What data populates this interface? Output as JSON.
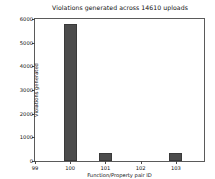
{
  "chart_data": {
    "type": "bar",
    "title": "Violations generated across 14610 uploads",
    "xlabel": "Function/Property pair ID",
    "ylabel": "Violations generated",
    "categories": [
      "100",
      "101",
      "103"
    ],
    "values": [
      5800,
      350,
      350
    ],
    "x": [
      100,
      101,
      103
    ],
    "xlim": [
      99,
      103.8
    ],
    "ylim": [
      0,
      6000
    ],
    "xticks": [
      99,
      100,
      101,
      102,
      103
    ],
    "xtick_labels": [
      "99",
      "100",
      "101",
      "102",
      "103"
    ],
    "yticks": [
      0,
      1000,
      2000,
      3000,
      4000,
      5000,
      6000
    ],
    "ytick_labels": [
      "0",
      "1000",
      "2000",
      "3000",
      "4000",
      "5000",
      "6000"
    ],
    "grid": false,
    "legend": null,
    "bar_color": "#4c4c4c",
    "bar_edge_color": "#3a3a3a",
    "bar_width": 0.36,
    "background_color": "#ffffff",
    "axes_color": "#5a5a5a"
  }
}
